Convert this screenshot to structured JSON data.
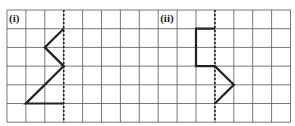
{
  "grid": {
    "cols": 15,
    "rows": 6,
    "x0": 7,
    "y0": 10,
    "cell_w": 18.9,
    "cell_h": 18.7,
    "line_color": "#555555",
    "stroke_color": "#222222"
  },
  "panels": [
    {
      "label": "(i)",
      "label_col": 0,
      "mirror_col": 3,
      "path": [
        [
          3,
          1
        ],
        [
          2,
          2
        ],
        [
          3,
          3
        ],
        [
          1,
          5
        ],
        [
          3,
          5
        ]
      ]
    },
    {
      "label": "(ii)",
      "label_col": 8,
      "mirror_col": 11,
      "path": [
        [
          11,
          1
        ],
        [
          10,
          1
        ],
        [
          10,
          3
        ],
        [
          11,
          3
        ],
        [
          12,
          4
        ],
        [
          11,
          5
        ]
      ]
    }
  ]
}
